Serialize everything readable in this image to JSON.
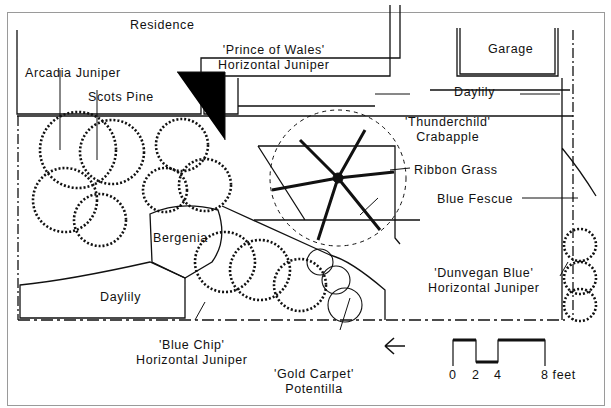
{
  "diagram": {
    "type": "landscape planting plan",
    "structures": {
      "residence": "Residence",
      "garage": "Garage"
    },
    "plants": [
      {
        "id": "arcadia",
        "label": "Arcadia Juniper"
      },
      {
        "id": "scots",
        "label": "Scots Pine"
      },
      {
        "id": "prince",
        "line1": "'Prince of Wales'",
        "line2": "Horizontal Juniper"
      },
      {
        "id": "daylily_top",
        "label": "Daylily"
      },
      {
        "id": "thunderchild",
        "line1": "'Thunderchild'",
        "line2": "Crabapple"
      },
      {
        "id": "ribbon",
        "label": "Ribbon Grass"
      },
      {
        "id": "fescue",
        "label": "Blue Fescue"
      },
      {
        "id": "bergenia",
        "label": "Bergenia"
      },
      {
        "id": "daylily_bottom",
        "label": "Daylily"
      },
      {
        "id": "dunvegan",
        "line1": "'Dunvegan Blue'",
        "line2": "Horizontal Juniper"
      },
      {
        "id": "bluechip",
        "line1": "'Blue Chip'",
        "line2": "Horizontal Juniper"
      },
      {
        "id": "goldcarpet",
        "line1": "'Gold Carpet'",
        "line2": "Potentilla"
      }
    ],
    "north_arrow": "←",
    "scale_bar": {
      "ticks": [
        "0",
        "2",
        "4",
        "8 feet"
      ]
    }
  }
}
